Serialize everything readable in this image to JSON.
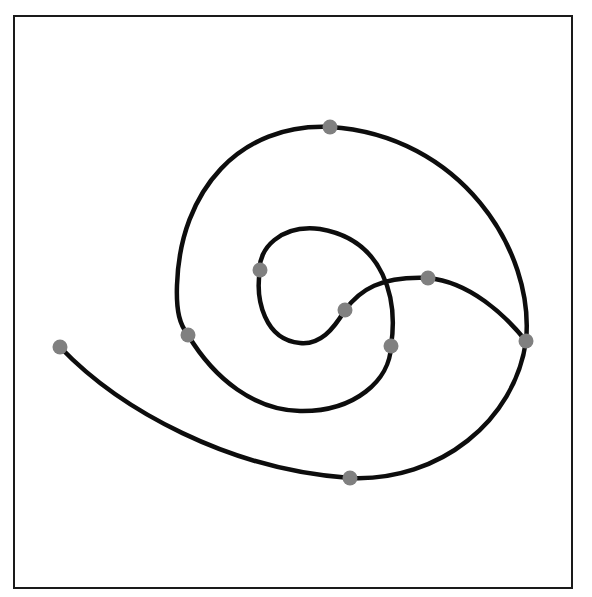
{
  "diagram": {
    "type": "spiral-curve",
    "background": "#ffffff",
    "frame": {
      "x": 14,
      "y": 16,
      "width": 558,
      "height": 572,
      "stroke": "#1a1a1a",
      "stroke_width": 2
    },
    "curve": {
      "stroke": "#0d0d0d",
      "stroke_width": 4.5,
      "d": "M 60 347 C 120 410, 230 470, 350 478 C 440 482, 515 420, 526 341 C 535 250, 460 135, 330 127 C 240 123, 180 190, 177 285 C 176 312, 180 325, 188 335 C 215 380, 255 410, 300 411 C 355 412, 390 380, 391 346 C 398 300, 385 240, 320 229 C 280 224, 258 250, 260 270 C 255 300, 265 340, 300 343 C 320 345, 333 330, 345 310 C 360 290, 380 276, 428 278 C 470 282, 505 315, 526 341"
    },
    "nodes_color": "#808080",
    "nodes_radius": 7.5,
    "nodes": [
      {
        "id": "n1",
        "x": 60,
        "y": 347
      },
      {
        "id": "n2",
        "x": 350,
        "y": 478
      },
      {
        "id": "n3",
        "x": 526,
        "y": 341
      },
      {
        "id": "n4",
        "x": 330,
        "y": 127
      },
      {
        "id": "n5",
        "x": 188,
        "y": 335
      },
      {
        "id": "n6",
        "x": 391,
        "y": 346
      },
      {
        "id": "n7",
        "x": 260,
        "y": 270
      },
      {
        "id": "n8",
        "x": 345,
        "y": 310
      },
      {
        "id": "n9",
        "x": 428,
        "y": 278
      }
    ]
  }
}
